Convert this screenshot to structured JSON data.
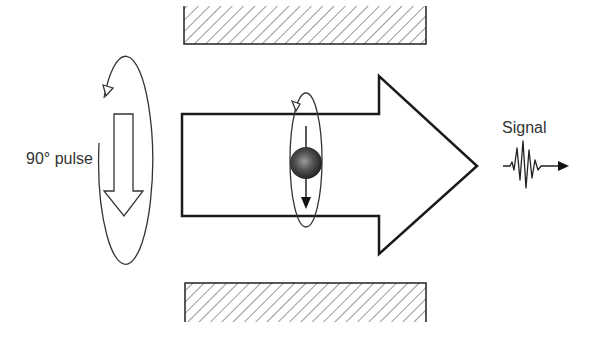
{
  "diagram": {
    "labels": {
      "pulse": "90° pulse",
      "signal": "Signal"
    },
    "elements": {
      "magnets": [
        "top-magnet-pole",
        "bottom-magnet-pole"
      ],
      "main_arrow": "main-magnetic-field-arrow",
      "pulse_arrow": "rf-pulse-arrow",
      "spin": "proton-spin",
      "signal_wave": "signal-waveform"
    },
    "colors": {
      "stroke": "#1a1a1a",
      "text": "#333333",
      "background": "#ffffff",
      "sphere_dark": "#222222",
      "sphere_light": "#8a8a8a"
    }
  }
}
